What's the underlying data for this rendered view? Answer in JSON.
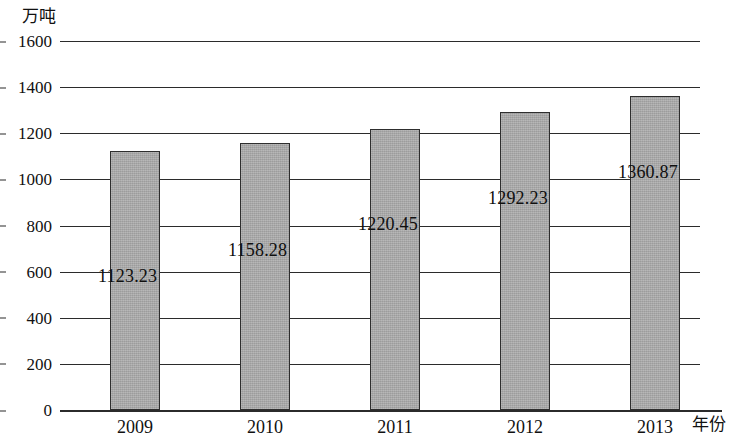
{
  "chart_data": {
    "type": "bar",
    "title": "",
    "xlabel": "年份",
    "ylabel": "万吨",
    "categories": [
      "2009",
      "2010",
      "2011",
      "2012",
      "2013"
    ],
    "values": [
      1123.23,
      1158.28,
      1220.45,
      1292.23,
      1360.87
    ],
    "value_labels": [
      "1123.23",
      "1158.28",
      "1220.45",
      "1292.23",
      "1360.87"
    ],
    "ylim": [
      0,
      1600
    ],
    "y_ticks": [
      "1600",
      "1400",
      "1200",
      "1000",
      "800",
      "600",
      "400",
      "200",
      "0"
    ],
    "y_tick_values": [
      1600,
      1400,
      1200,
      1000,
      800,
      600,
      400,
      200,
      0
    ],
    "grid": "horizontal",
    "legend": "none",
    "bar_color": "#a9a9a9",
    "bar_border_color": "#2e2e2e",
    "axis_color": "#2b2b2b"
  }
}
